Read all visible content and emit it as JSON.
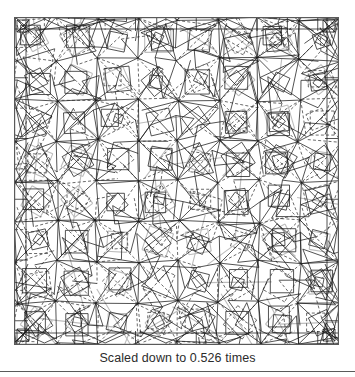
{
  "figure": {
    "kind": "origami-crease-pattern",
    "frame": {
      "x": 14,
      "y": 17,
      "width": 325,
      "height": 328,
      "border_color": "#5a5a5a"
    },
    "canvas": {
      "width": 325,
      "height": 328,
      "background": "#ffffff"
    },
    "grid": {
      "cell": 40.5,
      "columns": 8,
      "rows": 8,
      "margin": 2
    },
    "line_styles": {
      "solid": "#1a1a1a",
      "dashed": "#2a2a2a",
      "light": "#bdbdbd",
      "border": "#5a5a5a"
    },
    "line_widths": {
      "solid": 0.75,
      "dashed": 0.7,
      "light": 1.1,
      "border": 1.2
    },
    "dash_pattern": "3,2.2"
  },
  "caption": {
    "text": "Scaled down to 0.526 times",
    "scale_factor": "0.526",
    "color": "#2b2b2b"
  },
  "rules": {
    "bottom_rule_color": "#5a5a5a"
  }
}
